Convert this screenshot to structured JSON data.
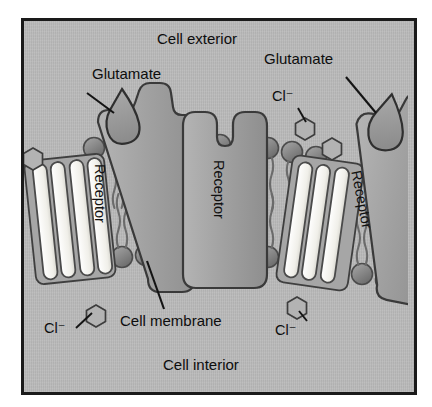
{
  "figure": {
    "type": "biology-diagram",
    "background_color": "#b8b8b8",
    "frame_color": "#1a1a1a",
    "page_color": "#ffffff"
  },
  "labels": {
    "cell_exterior": "Cell exterior",
    "cell_interior": "Cell interior",
    "cell_membrane": "Cell membrane",
    "glutamate_left": "Glutamate",
    "glutamate_right": "Glutamate",
    "receptor_left": "Receptor",
    "receptor_middle": "Receptor",
    "receptor_right": "Receptor",
    "chloride_top_right": "Cl⁻",
    "chloride_bottom_left": "Cl⁻",
    "chloride_bottom_right": "Cl⁻"
  },
  "colors": {
    "membrane_head": "#8a8a8a",
    "membrane_head_dark": "#6f6f6f",
    "membrane_tail": "#6b6b6b",
    "receptor_fill": "#a3a3a3",
    "receptor_stroke": "#3a3a3a",
    "glutamate_fill": "#9a9a9a",
    "channel_open_fill": "#f2f2ef",
    "channel_stroke": "#4a4a4a",
    "chloride_fill": "#b5b5b5",
    "chloride_stroke": "#3d3d3d",
    "leader_line": "#141414",
    "text": "#0d0d0d"
  },
  "elements": {
    "receptors": [
      {
        "id": "left",
        "state": "glutamate-bound",
        "channel": "open",
        "tilt_deg": -8,
        "label": "Receptor"
      },
      {
        "id": "middle",
        "state": "unbound",
        "channel": "closed",
        "tilt_deg": 0,
        "label": "Receptor"
      },
      {
        "id": "right",
        "state": "glutamate-bound",
        "channel": "open",
        "tilt_deg": 10,
        "label": "Receptor"
      }
    ],
    "chloride_ions": [
      {
        "id": "left-upper",
        "position": "exterior-left"
      },
      {
        "id": "left-lower",
        "position": "interior-left",
        "labelled": true
      },
      {
        "id": "right-upper",
        "position": "exterior-right",
        "labelled": true
      },
      {
        "id": "right-upper2",
        "position": "exterior-right"
      },
      {
        "id": "right-lower",
        "position": "interior-right",
        "labelled": true
      }
    ],
    "membrane": {
      "type": "phospholipid-bilayer",
      "leaflets": 2,
      "head_shape": "circle",
      "tail_shape": "wavy-double"
    }
  }
}
